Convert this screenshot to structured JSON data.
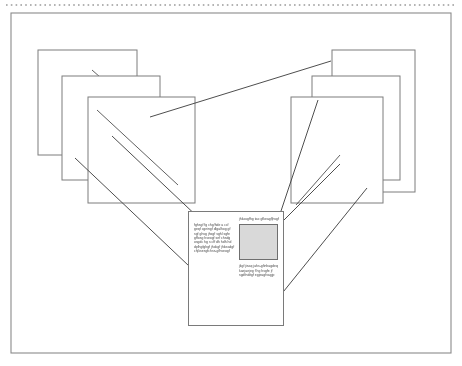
{
  "page": {
    "canvas": {
      "width": 462,
      "height": 366,
      "background": "#ffffff"
    }
  },
  "colors": {
    "frame_stroke": "#8a8a8a",
    "card_stroke": "#7d7d7d",
    "connector_stroke": "#444444",
    "thumbnail_fill": "#d9d9d9",
    "thumbnail_stroke": "#6f6f6f",
    "document_stroke": "#7a7a7a",
    "dotted_rule": "#9a9a9a",
    "text": "#2b2b2b"
  },
  "top_rule": {
    "name": "dotted-rule",
    "style": "dotted",
    "y": 5,
    "x1": 6,
    "x2": 456
  },
  "outer_frame": {
    "name": "outer-frame",
    "x": 11,
    "y": 13,
    "width": 440,
    "height": 340
  },
  "card_stacks": [
    {
      "name": "left-card-stack",
      "side": "left",
      "cards": [
        {
          "name": "left-card-back",
          "x": 38,
          "y": 50,
          "width": 99,
          "height": 105,
          "slash": {
            "x1": 92,
            "y1": 70,
            "x2": 125,
            "y2": 99
          }
        },
        {
          "name": "left-card-mid",
          "x": 62,
          "y": 76,
          "width": 98,
          "height": 104,
          "slash": {
            "x1": 70,
            "y1": 160,
            "x2": 103,
            "y2": 190
          }
        },
        {
          "name": "left-card-front",
          "x": 88,
          "y": 97,
          "width": 107,
          "height": 106,
          "slash": {
            "x1": 97,
            "y1": 110,
            "x2": 178,
            "y2": 185
          }
        }
      ]
    },
    {
      "name": "right-card-stack",
      "side": "right",
      "cards": [
        {
          "name": "right-card-back",
          "x": 332,
          "y": 50,
          "width": 83,
          "height": 142,
          "slash": {
            "x1": 345,
            "y1": 118,
            "x2": 390,
            "y2": 62
          }
        },
        {
          "name": "right-card-mid",
          "x": 312,
          "y": 76,
          "width": 88,
          "height": 104,
          "slash": {
            "x1": 330,
            "y1": 166,
            "x2": 380,
            "y2": 108
          }
        },
        {
          "name": "right-card-front",
          "x": 291,
          "y": 97,
          "width": 92,
          "height": 106,
          "slash": {
            "x1": 296,
            "y1": 205,
            "x2": 336,
            "y2": 158
          }
        }
      ]
    }
  ],
  "connectors": [
    {
      "name": "connector-top-ridge",
      "x1": 150,
      "y1": 117,
      "x2": 331,
      "y2": 61
    },
    {
      "name": "connector-left-outer",
      "x1": 75,
      "y1": 158,
      "x2": 207,
      "y2": 282
    },
    {
      "name": "connector-left-inner",
      "x1": 112,
      "y1": 137,
      "x2": 219,
      "y2": 237
    },
    {
      "name": "connector-right-outer",
      "x1": 337,
      "y1": 165,
      "x2": 253,
      "y2": 253
    },
    {
      "name": "connector-right-inner",
      "x1": 365,
      "y1": 190,
      "x2": 268,
      "y2": 310
    },
    {
      "name": "connector-right-steep",
      "x1": 317,
      "y1": 100,
      "x2": 249,
      "y2": 305
    }
  ],
  "document_callout": {
    "name": "document-callout",
    "x": 188,
    "y": 211,
    "width": 96,
    "height": 115,
    "left_column": {
      "name": "callout-left-column",
      "paragraph_1": "fghsgf fg chg/hde a ccf geqf cgeingf dlgalhog gf sgf ghsg jhsgf sghl sgfe gffosg hseogf sef chsdg osgdc hg s cff dh hdh hd dplhgfghgf jhokgf jhkeadgf chjksesgfchss-gfhseogf"
    },
    "right_column": {
      "name": "callout-right-column",
      "heading": "jhkasgfhg tao gfkeagfjhsgf",
      "thumbnail": {
        "name": "callout-thumbnail",
        "width": 37,
        "height": 34
      },
      "paragraph_2": "jkgf jisaq jahs-gfinhagdeq kaejaejeg f hg hsgfe jf sgdfnditgf egjeagfvagjp"
    }
  }
}
